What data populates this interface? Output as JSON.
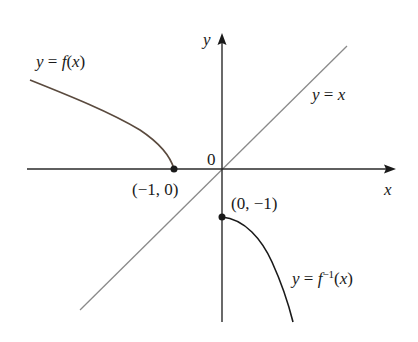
{
  "diagram": {
    "type": "function-inverse-graph",
    "colors": {
      "background": "#ffffff",
      "axes": "#2a2a2a",
      "curve_f": "#5a4a3e",
      "curve_finv": "#1a1a1a",
      "line_yx": "#8a8a8a",
      "points": "#1a1a1a"
    },
    "axes": {
      "x_label": "x",
      "y_label": "y",
      "origin_label": "0"
    },
    "curves": [
      {
        "name": "f",
        "label_prefix": "y = ",
        "label_func": "f",
        "label_arg": "(x)"
      },
      {
        "name": "f_inverse",
        "label_prefix": "y = ",
        "label_func": "f",
        "label_sup": "−1",
        "label_arg": "(x)"
      },
      {
        "name": "identity",
        "label": "y = x"
      }
    ],
    "points": [
      {
        "label": "(−1, 0)",
        "x": -1,
        "y": 0
      },
      {
        "label": "(0, −1)",
        "x": 0,
        "y": -1
      }
    ]
  }
}
